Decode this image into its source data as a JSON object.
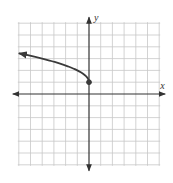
{
  "chart_data": {
    "type": "line",
    "title": "",
    "function": "y = sqrt(-x) + 1",
    "xlabel": "x",
    "ylabel": "y",
    "xlim": [
      -6,
      6
    ],
    "ylim": [
      -6,
      6
    ],
    "grid": true,
    "grid_step": 1,
    "colors": {
      "grid": "#c8c8c8",
      "axis": "#333333",
      "curve": "#3a3a3a"
    },
    "series": [
      {
        "name": "f(x)",
        "domain": [
          -6,
          0
        ],
        "endpoint": {
          "x": 0,
          "y": 1,
          "closed": true
        },
        "arrow_end": {
          "x": -6,
          "y": 3.449
        },
        "points": [
          {
            "x": -6,
            "y": 3.449
          },
          {
            "x": -5,
            "y": 3.236
          },
          {
            "x": -4,
            "y": 3
          },
          {
            "x": -3,
            "y": 2.732
          },
          {
            "x": -2,
            "y": 2.414
          },
          {
            "x": -1,
            "y": 2
          },
          {
            "x": -0.5,
            "y": 1.707
          },
          {
            "x": -0.1,
            "y": 1.316
          },
          {
            "x": 0,
            "y": 1
          }
        ]
      }
    ]
  }
}
